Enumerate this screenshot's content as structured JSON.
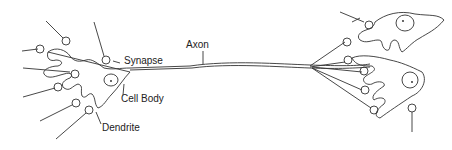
{
  "diagram": {
    "type": "neuron-anatomy",
    "labels": {
      "axon": "Axon",
      "synapse": "Synapse",
      "cell_body": "Cell Body",
      "dendrite": "Dendrite"
    }
  }
}
